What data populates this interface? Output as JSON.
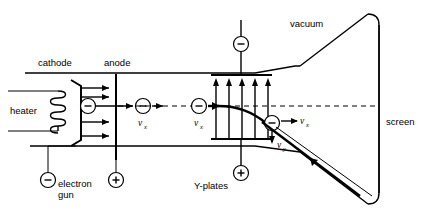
{
  "figure": {
    "type": "physics-schematic",
    "width": 424,
    "height": 218,
    "line_color": "#000000",
    "background_color": "#ffffff"
  },
  "labels": {
    "heater": "heater",
    "cathode": "cathode",
    "anode": "anode",
    "electron_gun_line1": "electron",
    "electron_gun_line2": "gun",
    "y_plates": "Y-plates",
    "vacuum": "vacuum",
    "screen": "screen"
  },
  "velocity_labels": [
    {
      "id": "vx-after-anode",
      "symbol": "v",
      "subscript": "x"
    },
    {
      "id": "vx-before-plates",
      "symbol": "v",
      "subscript": "x"
    },
    {
      "id": "vx-after-plates",
      "symbol": "v",
      "subscript": "x"
    },
    {
      "id": "vy-deflection",
      "symbol": "v",
      "subscript": "y"
    }
  ],
  "terminals": [
    {
      "id": "electron-gun-terminal",
      "sign": "−",
      "label": "electron gun"
    },
    {
      "id": "anode-terminal",
      "sign": "+",
      "label": "anode supply"
    },
    {
      "id": "y-plate-top-terminal",
      "sign": "−",
      "label": "upper Y-plate"
    },
    {
      "id": "y-plate-bottom-terminal",
      "sign": "+",
      "label": "lower Y-plate"
    }
  ],
  "electrons": [
    {
      "id": "electron-in-cathode",
      "sign": "−"
    },
    {
      "id": "electron-at-anode",
      "sign": "−"
    },
    {
      "id": "electron-before-plates",
      "sign": "−"
    },
    {
      "id": "electron-after-plates",
      "sign": "−"
    }
  ],
  "counts": {
    "cathode_emission_arrows": 5,
    "field_arrows_between_plates": 5,
    "heater_coil_turns": 6
  }
}
